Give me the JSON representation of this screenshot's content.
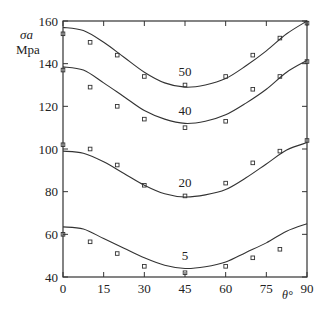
{
  "chart_data": {
    "type": "line",
    "title": "",
    "xlabel": "θ°",
    "ylabel_symbol": "σa",
    "ylabel_unit": "Mpa",
    "xlim": [
      0,
      90
    ],
    "ylim": [
      40,
      160
    ],
    "xticks": [
      0,
      15,
      30,
      45,
      60,
      75,
      90
    ],
    "yticks": [
      40,
      60,
      80,
      100,
      120,
      140,
      160
    ],
    "grid": false,
    "legend": "inline curve labels",
    "series": [
      {
        "name": "50",
        "curve_x": [
          0,
          7.5,
          15,
          22.5,
          30,
          37.5,
          45,
          52.5,
          60,
          67.5,
          75,
          82.5,
          90
        ],
        "curve_y": [
          157,
          155.5,
          150,
          143,
          136,
          131,
          129,
          130,
          133,
          139,
          146,
          154,
          160
        ],
        "points_x": [
          0,
          10,
          20,
          30,
          45,
          60,
          70,
          80,
          90
        ],
        "points_y": [
          154,
          150,
          144,
          134,
          130,
          134,
          144,
          152,
          159
        ],
        "label_pos": [
          45,
          134
        ]
      },
      {
        "name": "40",
        "curve_x": [
          0,
          7.5,
          15,
          22.5,
          30,
          37.5,
          45,
          52.5,
          60,
          67.5,
          75,
          82.5,
          90
        ],
        "curve_y": [
          138.5,
          137,
          131,
          124.5,
          118,
          114,
          112,
          113,
          116,
          121.5,
          128,
          136,
          141.5
        ],
        "points_x": [
          0,
          10,
          20,
          30,
          45,
          60,
          70,
          80,
          90
        ],
        "points_y": [
          137,
          129,
          120,
          114,
          110,
          113,
          128,
          134,
          141
        ],
        "label_pos": [
          45,
          116
        ]
      },
      {
        "name": "20",
        "curve_x": [
          0,
          7.5,
          15,
          22.5,
          30,
          37.5,
          45,
          52.5,
          60,
          67.5,
          75,
          82.5,
          90
        ],
        "curve_y": [
          99,
          98,
          94,
          88.5,
          83,
          79,
          77.5,
          78.5,
          81,
          86.5,
          93,
          99.5,
          103
        ],
        "points_x": [
          0,
          10,
          20,
          30,
          45,
          60,
          70,
          80,
          90
        ],
        "points_y": [
          102,
          100,
          92.5,
          83,
          78,
          84,
          93.5,
          99,
          104
        ],
        "label_pos": [
          45,
          82
        ]
      },
      {
        "name": "5",
        "curve_x": [
          0,
          7.5,
          15,
          22.5,
          30,
          37.5,
          45,
          52.5,
          60,
          67.5,
          75,
          82.5,
          90
        ],
        "curve_y": [
          63.5,
          62.5,
          58,
          53.5,
          49,
          45.5,
          44,
          44.8,
          47,
          51.5,
          56,
          61.5,
          65
        ],
        "points_x": [
          0,
          10,
          20,
          30,
          45,
          60,
          70,
          80
        ],
        "points_y": [
          60,
          56.5,
          51,
          45,
          42,
          45,
          49,
          53
        ],
        "label_pos": [
          45,
          48
        ]
      }
    ],
    "plot_area_px": {
      "left": 63,
      "top": 21,
      "right": 307,
      "bottom": 277
    },
    "colors": {
      "line": "#333333",
      "axis": "#333333",
      "marker": "#333333"
    }
  }
}
